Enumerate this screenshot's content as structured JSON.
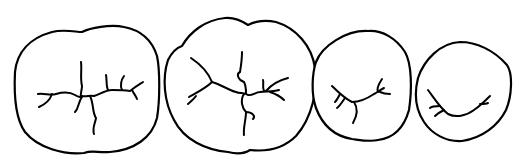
{
  "diagram": {
    "type": "line-drawing",
    "colors": {
      "line": "#000000",
      "background": "#ffffff"
    },
    "teeth": [
      {
        "name": "tooth-1",
        "shape": "large molar",
        "grooves": "cross-shaped central fissure with branching"
      },
      {
        "name": "tooth-2",
        "shape": "large molar",
        "grooves": "Y/cross fissure pattern with branches"
      },
      {
        "name": "tooth-3",
        "shape": "premolar",
        "grooves": "curved central fissure with branches"
      },
      {
        "name": "tooth-4",
        "shape": "small premolar",
        "grooves": "U-shaped central fissure"
      }
    ]
  }
}
